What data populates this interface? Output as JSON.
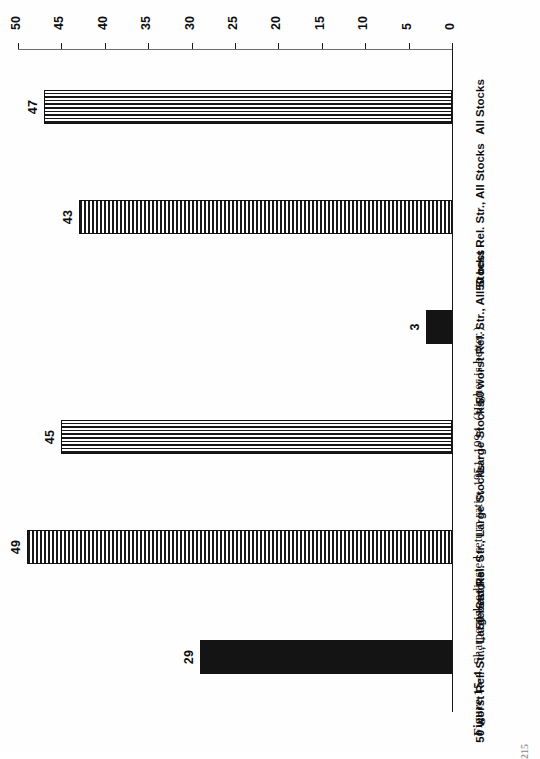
{
  "figure": {
    "number_label": "Figure 15-4.",
    "caption_text": "Sharpe risk-adjusted return ratio, 1951–1994. (Higher is better.)",
    "page_number": "215"
  },
  "chart_data": {
    "type": "bar",
    "title": "",
    "subtitle": "",
    "xlabel": "",
    "ylabel": "",
    "orientation": "vertical-printed-rotated",
    "grid": false,
    "legend_position": "none",
    "ylim": [
      0,
      50
    ],
    "yticks": [
      0,
      5,
      10,
      15,
      20,
      25,
      30,
      35,
      40,
      45,
      50
    ],
    "ytick_labels": [
      "0",
      "5",
      "10",
      "15",
      "20",
      "25",
      "30",
      "35",
      "40",
      "45",
      "50"
    ],
    "categories": [
      "50 worst Rel. Str., Large Stocks",
      "50 best Rel. Str., Large Stocks",
      "Large Stocks",
      "50 worst Rel. Str., All Stocks",
      "50 best Rel. Str., All Stocks",
      "All Stocks"
    ],
    "values": [
      29,
      49,
      45,
      3,
      43,
      47
    ],
    "value_labels": [
      "29",
      "49",
      "45",
      "3",
      "43",
      "47"
    ],
    "fills": [
      "solid",
      "hhatch",
      "vhatch",
      "solid",
      "hhatch",
      "vhatch"
    ],
    "colors": {
      "ink": "#141414",
      "paper": "#ffffff",
      "axis": "#1a1a1a"
    }
  }
}
